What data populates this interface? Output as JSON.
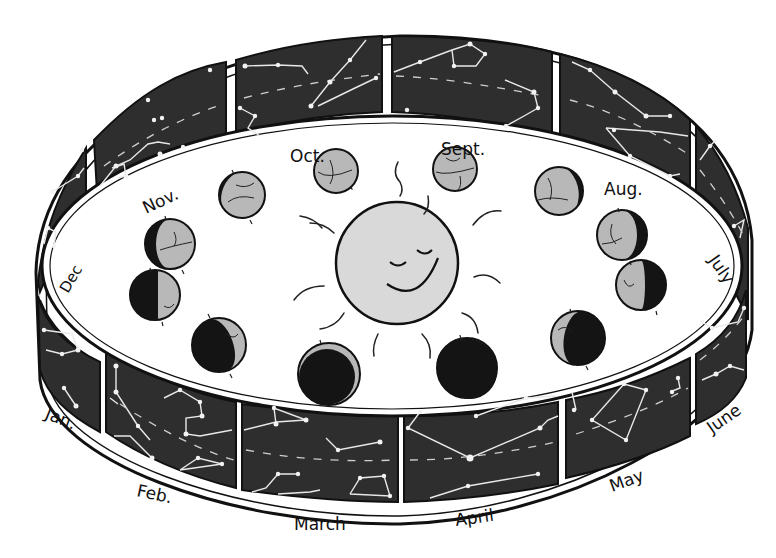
{
  "figure": {
    "colors": {
      "background": "#ffffff",
      "band_panel": "#2e2e2e",
      "band_frame": "#111111",
      "sun_fill": "#d9d9d9",
      "earth_lit": "#b8b8b8",
      "earth_shadow": "#141414",
      "stars": "#f2f2f2"
    },
    "sun": {
      "label": "Sun",
      "expression": "smiling-face"
    },
    "months": [
      {
        "id": "jan",
        "label": "Jan."
      },
      {
        "id": "feb",
        "label": "Feb."
      },
      {
        "id": "mar",
        "label": "March"
      },
      {
        "id": "apr",
        "label": "April"
      },
      {
        "id": "may",
        "label": "May"
      },
      {
        "id": "jun",
        "label": "June"
      },
      {
        "id": "jul",
        "label": "July"
      },
      {
        "id": "aug",
        "label": "Aug."
      },
      {
        "id": "sep",
        "label": "Sept."
      },
      {
        "id": "oct",
        "label": "Oct."
      },
      {
        "id": "nov",
        "label": "Nov."
      },
      {
        "id": "dec",
        "label": "Dec"
      }
    ],
    "earth_positions": [
      {
        "name": "earth-oct-1",
        "phase": "mostly-lit"
      },
      {
        "name": "earth-oct-2",
        "phase": "full-lit"
      },
      {
        "name": "earth-sept-1",
        "phase": "full-lit"
      },
      {
        "name": "earth-sept-2",
        "phase": "mostly-lit"
      },
      {
        "name": "earth-aug-1",
        "phase": "gibbous"
      },
      {
        "name": "earth-aug-2",
        "phase": "half"
      },
      {
        "name": "earth-jun",
        "phase": "crescent"
      },
      {
        "name": "earth-may",
        "phase": "mostly-dark"
      },
      {
        "name": "earth-apr",
        "phase": "mostly-dark"
      },
      {
        "name": "earth-feb",
        "phase": "crescent"
      },
      {
        "name": "earth-jan",
        "phase": "half"
      },
      {
        "name": "earth-nov",
        "phase": "gibbous"
      }
    ],
    "band": {
      "description": "Cylindrical strip of night-sky panels showing zodiac constellations, one panel per month"
    }
  }
}
